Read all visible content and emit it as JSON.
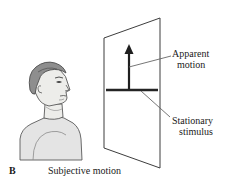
{
  "figure": {
    "panel_letter": "B",
    "caption": "Subjective motion",
    "annotations": {
      "apparent": {
        "line1": "Apparent",
        "line2": "motion"
      },
      "stationary": {
        "line1": "Stationary",
        "line2": "stimulus"
      }
    },
    "icon_names": {
      "observer": "head-profile-icon",
      "screen": "screen-panel-icon",
      "arrow": "up-arrow-icon",
      "bar": "horizontal-bar-icon"
    },
    "colors": {
      "ink": "#1a1a1a",
      "outline": "#555555",
      "hair": "#8e8e8e",
      "skin": "#ededea",
      "shirt": "#e2e2e2",
      "bar": "#2a2a2a",
      "leader": "#666666"
    }
  }
}
